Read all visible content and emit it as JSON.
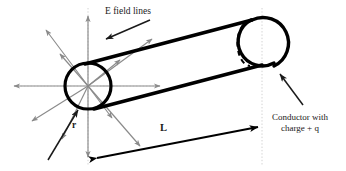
{
  "figure": {
    "background_color": "#ffffff",
    "width": 346,
    "height": 171
  },
  "labels": {
    "efield": "E field lines",
    "conductor_line1": "Conductor with",
    "conductor_line2": "charge + q",
    "conductor_full": "Conductor with charge + q",
    "radius": "r",
    "length": "L"
  },
  "colors": {
    "field_line": "#8a8a8a",
    "conductor_outline": "#000000",
    "guide_line": "#c9c9c9",
    "pointer_arrow": "#1a1a1a",
    "dimension_arrow": "#000000",
    "text": "#1a1a1a"
  },
  "geometry": {
    "cylinder": {
      "left_cap_center_x": 88,
      "left_cap_center_y": 86,
      "left_cap_rx": 23,
      "left_cap_ry": 23,
      "right_cap_center_x": 263,
      "right_cap_center_y": 43,
      "axis_angle_deg": -14
    },
    "field_origin": {
      "x": 88,
      "y": 86
    },
    "dimension_L": {
      "x1": 95,
      "y1": 159,
      "x2": 262,
      "y2": 127
    }
  },
  "elements": {
    "field_lines_count": 12,
    "dashed_arc": "hidden back edge of cylinder far cap",
    "dotted_vertical_guides": 2
  }
}
